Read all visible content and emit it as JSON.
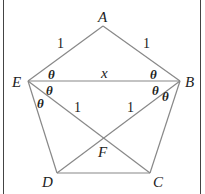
{
  "diagram": {
    "type": "regular pentagon with diagonals",
    "vertices": {
      "A": "A",
      "B": "B",
      "C": "C",
      "D": "D",
      "E": "E",
      "F": "F"
    },
    "side_labels": {
      "EA": "1",
      "AB": "1",
      "EF": "1",
      "BF": "1"
    },
    "diagonal_label": {
      "EB": "x"
    },
    "angle_label": "θ",
    "colors": {
      "lines": "#888888",
      "text": "#222222",
      "border": "#444444"
    }
  }
}
